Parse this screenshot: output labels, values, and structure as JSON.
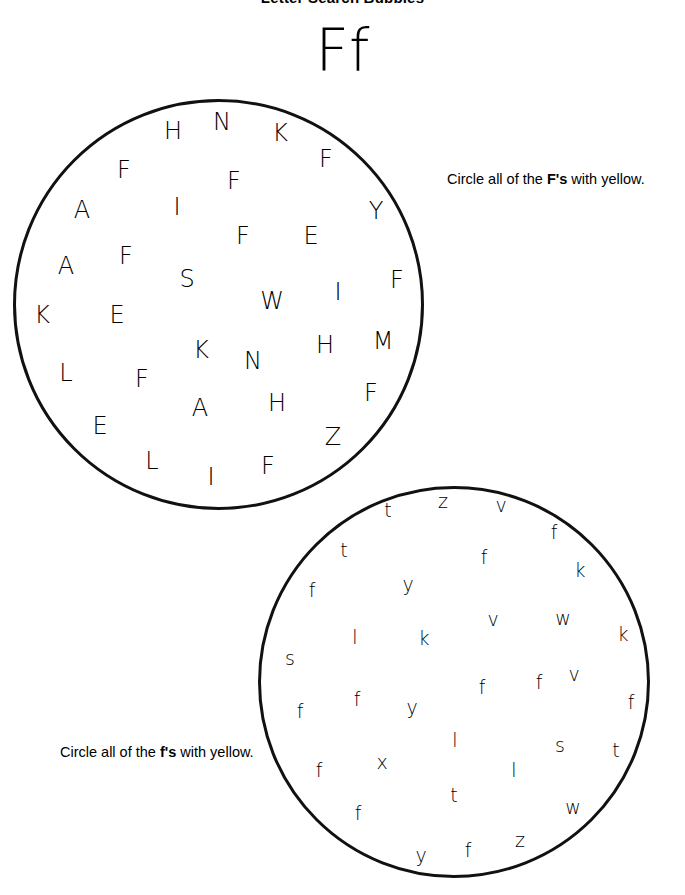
{
  "page": {
    "title": "Letter Search Bubbles",
    "letter_heading": "Ff"
  },
  "instructions": {
    "upper": {
      "prefix": "Circle all of the ",
      "target": "F's",
      "suffix": " with yellow."
    },
    "lower": {
      "prefix": "Circle all of the ",
      "target": "f's",
      "suffix": " with yellow."
    }
  },
  "bubbles": [
    {
      "id": "upper",
      "case": "uppercase",
      "target_letter": "F",
      "letters": [
        {
          "ch": "H",
          "x": 173,
          "y": 131
        },
        {
          "ch": "N",
          "x": 222,
          "y": 122
        },
        {
          "ch": "K",
          "x": 280,
          "y": 133
        },
        {
          "ch": "F",
          "x": 124,
          "y": 170
        },
        {
          "ch": "F",
          "x": 234,
          "y": 181
        },
        {
          "ch": "F",
          "x": 326,
          "y": 159
        },
        {
          "ch": "A",
          "x": 82,
          "y": 210
        },
        {
          "ch": "I",
          "x": 177,
          "y": 207
        },
        {
          "ch": "Y",
          "x": 376,
          "y": 211
        },
        {
          "ch": "F",
          "x": 243,
          "y": 236
        },
        {
          "ch": "E",
          "x": 311,
          "y": 236
        },
        {
          "ch": "F",
          "x": 126,
          "y": 256
        },
        {
          "ch": "A",
          "x": 66,
          "y": 266
        },
        {
          "ch": "S",
          "x": 187,
          "y": 279
        },
        {
          "ch": "F",
          "x": 397,
          "y": 280
        },
        {
          "ch": "W",
          "x": 272,
          "y": 301
        },
        {
          "ch": "I",
          "x": 338,
          "y": 292
        },
        {
          "ch": "K",
          "x": 42,
          "y": 315
        },
        {
          "ch": "E",
          "x": 117,
          "y": 315
        },
        {
          "ch": "K",
          "x": 201,
          "y": 350
        },
        {
          "ch": "N",
          "x": 253,
          "y": 361
        },
        {
          "ch": "H",
          "x": 325,
          "y": 345
        },
        {
          "ch": "M",
          "x": 383,
          "y": 341
        },
        {
          "ch": "L",
          "x": 66,
          "y": 373
        },
        {
          "ch": "F",
          "x": 142,
          "y": 379
        },
        {
          "ch": "A",
          "x": 200,
          "y": 408
        },
        {
          "ch": "H",
          "x": 277,
          "y": 403
        },
        {
          "ch": "F",
          "x": 371,
          "y": 393
        },
        {
          "ch": "E",
          "x": 100,
          "y": 426
        },
        {
          "ch": "Z",
          "x": 333,
          "y": 437
        },
        {
          "ch": "L",
          "x": 152,
          "y": 461
        },
        {
          "ch": "I",
          "x": 211,
          "y": 477
        },
        {
          "ch": "F",
          "x": 268,
          "y": 466
        }
      ]
    },
    {
      "id": "lower",
      "case": "lowercase",
      "target_letter": "f",
      "letters": [
        {
          "ch": "t",
          "x": 388,
          "y": 510
        },
        {
          "ch": "z",
          "x": 443,
          "y": 501
        },
        {
          "ch": "v",
          "x": 501,
          "y": 505
        },
        {
          "ch": "f",
          "x": 554,
          "y": 532
        },
        {
          "ch": "t",
          "x": 344,
          "y": 550
        },
        {
          "ch": "f",
          "x": 484,
          "y": 557
        },
        {
          "ch": "f",
          "x": 312,
          "y": 590
        },
        {
          "ch": "y",
          "x": 408,
          "y": 584
        },
        {
          "ch": "k",
          "x": 580,
          "y": 570
        },
        {
          "ch": "v",
          "x": 493,
          "y": 619
        },
        {
          "ch": "w",
          "x": 563,
          "y": 618
        },
        {
          "ch": "l",
          "x": 355,
          "y": 637
        },
        {
          "ch": "k",
          "x": 424,
          "y": 638
        },
        {
          "ch": "k",
          "x": 623,
          "y": 634
        },
        {
          "ch": "s",
          "x": 290,
          "y": 658
        },
        {
          "ch": "f",
          "x": 482,
          "y": 687
        },
        {
          "ch": "f",
          "x": 539,
          "y": 682
        },
        {
          "ch": "v",
          "x": 574,
          "y": 674
        },
        {
          "ch": "f",
          "x": 300,
          "y": 711
        },
        {
          "ch": "f",
          "x": 357,
          "y": 699
        },
        {
          "ch": "y",
          "x": 412,
          "y": 707
        },
        {
          "ch": "f",
          "x": 631,
          "y": 702
        },
        {
          "ch": "l",
          "x": 455,
          "y": 740
        },
        {
          "ch": "s",
          "x": 560,
          "y": 745
        },
        {
          "ch": "t",
          "x": 616,
          "y": 750
        },
        {
          "ch": "f",
          "x": 319,
          "y": 770
        },
        {
          "ch": "x",
          "x": 382,
          "y": 762
        },
        {
          "ch": "l",
          "x": 514,
          "y": 770
        },
        {
          "ch": "t",
          "x": 454,
          "y": 795
        },
        {
          "ch": "w",
          "x": 573,
          "y": 807
        },
        {
          "ch": "f",
          "x": 358,
          "y": 813
        },
        {
          "ch": "z",
          "x": 520,
          "y": 840
        },
        {
          "ch": "y",
          "x": 421,
          "y": 855
        },
        {
          "ch": "f",
          "x": 468,
          "y": 850
        }
      ]
    }
  ]
}
